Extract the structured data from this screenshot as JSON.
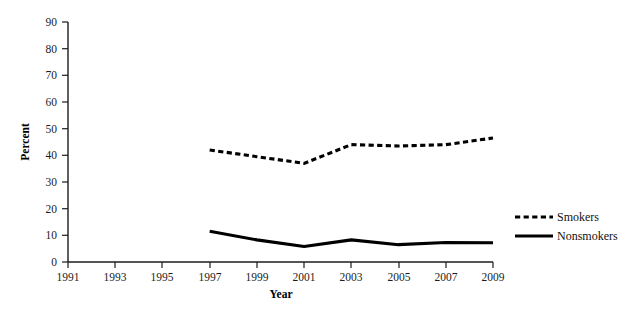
{
  "chart_data": {
    "type": "line",
    "title": "",
    "xlabel": "Year",
    "ylabel": "Percent",
    "x": [
      1991,
      1993,
      1995,
      1997,
      1999,
      2001,
      2003,
      2005,
      2007,
      2009
    ],
    "xtick_labels": [
      "1991",
      "1993",
      "1995",
      "1997",
      "1999",
      "2001",
      "2003",
      "2005",
      "2007",
      "2009"
    ],
    "xlim": [
      1991,
      2009
    ],
    "ylim": [
      0,
      90
    ],
    "ytick_labels": [
      "0",
      "10",
      "20",
      "30",
      "40",
      "50",
      "60",
      "70",
      "80",
      "90"
    ],
    "ytick_values": [
      0,
      10,
      20,
      30,
      40,
      50,
      60,
      70,
      80,
      90
    ],
    "grid": false,
    "legend_position": "right",
    "series": [
      {
        "name": "Smokers",
        "style": "dashed",
        "color": "#000000",
        "x": [
          1997,
          1999,
          2001,
          2003,
          2005,
          2007,
          2009
        ],
        "values": [
          42,
          39.5,
          37,
          44,
          43.5,
          44,
          46.5
        ]
      },
      {
        "name": "Nonsmokers",
        "style": "solid",
        "color": "#000000",
        "x": [
          1997,
          1999,
          2001,
          2003,
          2005,
          2007,
          2009
        ],
        "values": [
          11.5,
          8.3,
          5.8,
          8.3,
          6.5,
          7.3,
          7.2
        ]
      }
    ]
  },
  "axes": {
    "y_title": "Percent",
    "x_title": "Year"
  },
  "legend": {
    "entries": [
      {
        "label": "Smokers",
        "style": "dashed"
      },
      {
        "label": "Nonsmokers",
        "style": "solid"
      }
    ]
  },
  "colors": {
    "ink": "#000000",
    "axis": "#1c1c1c",
    "background": "#ffffff"
  }
}
